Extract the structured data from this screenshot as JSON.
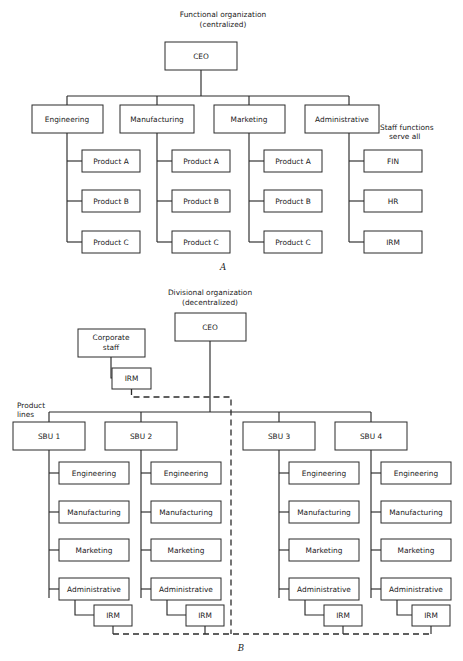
{
  "figure": {
    "kind": "organization-chart-pair",
    "background_color": "#ffffff",
    "line_color": "#2b2b2b",
    "box_fill": "#ffffff"
  },
  "panel_a": {
    "letter": "A",
    "title_line1": "Functional organization",
    "title_line2": "(centralized)",
    "root": "CEO",
    "annotation_line1": "Staff functions",
    "annotation_line2": "serve all",
    "columns": [
      {
        "head": "Engineering",
        "children": [
          "Product A",
          "Product B",
          "Product C"
        ]
      },
      {
        "head": "Manufacturing",
        "children": [
          "Product A",
          "Product B",
          "Product C"
        ]
      },
      {
        "head": "Marketing",
        "children": [
          "Product A",
          "Product B",
          "Product C"
        ]
      },
      {
        "head": "Administrative",
        "children": [
          "FIN",
          "HR",
          "IRM"
        ]
      }
    ]
  },
  "panel_b": {
    "letter": "B",
    "title_line1": "Divisional organization",
    "title_line2": "(decentralized)",
    "root": "CEO",
    "corporate_staff_line1": "Corporate",
    "corporate_staff_line2": "staff",
    "corporate_irm": "IRM",
    "product_lines_line1": "Product",
    "product_lines_line2": "lines",
    "columns": [
      {
        "head": "SBU 1",
        "children": [
          "Engineering",
          "Manufacturing",
          "Marketing",
          "Administrative"
        ],
        "irm": "IRM"
      },
      {
        "head": "SBU 2",
        "children": [
          "Engineering",
          "Manufacturing",
          "Marketing",
          "Administrative"
        ],
        "irm": "IRM"
      },
      {
        "head": "SBU 3",
        "children": [
          "Engineering",
          "Manufacturing",
          "Marketing",
          "Administrative"
        ],
        "irm": "IRM"
      },
      {
        "head": "SBU 4",
        "children": [
          "Engineering",
          "Manufacturing",
          "Marketing",
          "Administrative"
        ],
        "irm": "IRM"
      }
    ]
  }
}
